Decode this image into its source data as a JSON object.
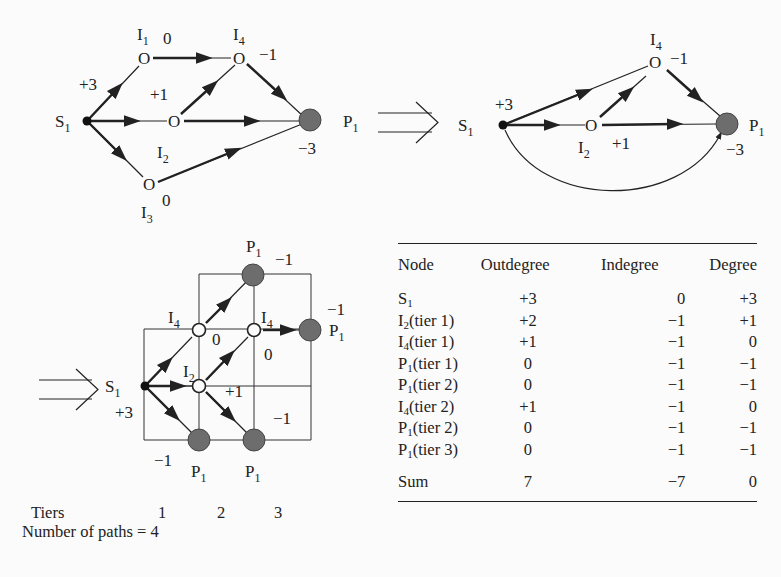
{
  "top_left_graph": {
    "nodes": {
      "S1": {
        "name": "S",
        "sub": "1"
      },
      "I1": {
        "name": "I",
        "sub": "1",
        "value": "0"
      },
      "I2": {
        "name": "I",
        "sub": "2"
      },
      "I3": {
        "name": "I",
        "sub": "3",
        "value": "0"
      },
      "I4": {
        "name": "I",
        "sub": "4",
        "value": "−1"
      },
      "P1": {
        "name": "P",
        "sub": "1",
        "value": "−3"
      }
    },
    "edge_labels": {
      "source_out": "+3",
      "mid": "+1"
    }
  },
  "implies_symbol": "⟹",
  "top_right_graph": {
    "nodes": {
      "S1": {
        "name": "S",
        "sub": "1",
        "value": "+3"
      },
      "I2": {
        "name": "I",
        "sub": "2",
        "value": "+1"
      },
      "I4": {
        "name": "I",
        "sub": "4",
        "value": "−1"
      },
      "P1": {
        "name": "P",
        "sub": "1",
        "value": "−3"
      }
    }
  },
  "tiered_graph": {
    "nodes": {
      "S1": {
        "name": "S",
        "sub": "1",
        "value": "+3"
      },
      "I2": {
        "name": "I",
        "sub": "2",
        "value": "+1"
      },
      "I4a": {
        "name": "I",
        "sub": "4",
        "value": "0"
      },
      "I4b": {
        "name": "I",
        "sub": "4",
        "value": "0"
      },
      "P1_top": {
        "name": "P",
        "sub": "1",
        "value": "−1"
      },
      "P1_right": {
        "name": "P",
        "sub": "1",
        "value": "−1"
      },
      "P1_bottom_left": {
        "name": "P",
        "sub": "1",
        "value": "−1"
      },
      "P1_bottom_right": {
        "name": "P",
        "sub": "1",
        "value": "−1"
      }
    },
    "tiers_label": "Tiers",
    "tiers": [
      "1",
      "2",
      "3"
    ],
    "paths_label": "Number of paths = 4"
  },
  "degree_table": {
    "headers": [
      "Node",
      "Outdegree",
      "Indegree",
      "Degree"
    ],
    "rows": [
      {
        "node": "S",
        "sub": "1",
        "suffix": "",
        "out": "+3",
        "in": "0",
        "deg": "+3"
      },
      {
        "node": "I",
        "sub": "2",
        "suffix": "(tier 1)",
        "out": "+2",
        "in": "−1",
        "deg": "+1"
      },
      {
        "node": "I",
        "sub": "4",
        "suffix": "(tier 1)",
        "out": "+1",
        "in": "−1",
        "deg": "0"
      },
      {
        "node": "P",
        "sub": "1",
        "suffix": "(tier 1)",
        "out": "0",
        "in": "−1",
        "deg": "−1"
      },
      {
        "node": "P",
        "sub": "1",
        "suffix": "(tier 2)",
        "out": "0",
        "in": "−1",
        "deg": "−1"
      },
      {
        "node": "I",
        "sub": "4",
        "suffix": "(tier 2)",
        "out": "+1",
        "in": "−1",
        "deg": "0"
      },
      {
        "node": "P",
        "sub": "1",
        "suffix": "(tier 2)",
        "out": "0",
        "in": "−1",
        "deg": "−1"
      },
      {
        "node": "P",
        "sub": "1",
        "suffix": "(tier 3)",
        "out": "0",
        "in": "−1",
        "deg": "−1"
      }
    ],
    "sum": {
      "label": "Sum",
      "out": "7",
      "in": "−7",
      "deg": "0"
    }
  }
}
